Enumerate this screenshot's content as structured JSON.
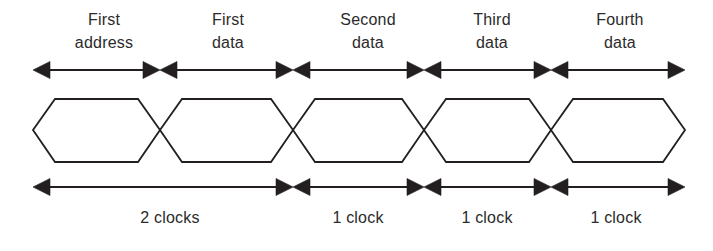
{
  "diagram": {
    "type": "timing-waveform",
    "line_color": "#231f20",
    "text_color": "#2b2b2b",
    "background_color": "#ffffff",
    "line_width": 1.8
  },
  "geometry": {
    "left": 33,
    "right": 685,
    "boundaries": [
      33,
      160,
      293,
      424,
      551,
      685
    ],
    "top_arrow_y": 70,
    "bottom_arrow_y": 187,
    "wave_top": 99,
    "wave_bottom": 162,
    "wave_mid": 130,
    "bevel": 22
  },
  "top_labels": [
    {
      "line1": "First",
      "line2": "address",
      "center_x": 104,
      "top_y": 8
    },
    {
      "line1": "First",
      "line2": "data",
      "center_x": 228,
      "top_y": 8
    },
    {
      "line1": "Second",
      "line2": "data",
      "center_x": 368,
      "top_y": 8
    },
    {
      "line1": "Third",
      "line2": "data",
      "center_x": 492,
      "top_y": 8
    },
    {
      "line1": "Fourth",
      "line2": "data",
      "center_x": 620,
      "top_y": 8
    }
  ],
  "top_arrows": [
    {
      "name": "first-address-span",
      "x1": 33,
      "x2": 160
    },
    {
      "name": "first-data-span",
      "x1": 160,
      "x2": 293
    },
    {
      "name": "second-data-span",
      "x1": 293,
      "x2": 424
    },
    {
      "name": "third-data-span",
      "x1": 424,
      "x2": 551
    },
    {
      "name": "fourth-data-span",
      "x1": 551,
      "x2": 685
    }
  ],
  "wave_cells": [
    {
      "name": "first-address-cell",
      "x1": 33,
      "x2": 160
    },
    {
      "name": "first-data-cell",
      "x1": 160,
      "x2": 293
    },
    {
      "name": "second-data-cell",
      "x1": 293,
      "x2": 424
    },
    {
      "name": "third-data-cell",
      "x1": 424,
      "x2": 551
    },
    {
      "name": "fourth-data-cell",
      "x1": 551,
      "x2": 685
    }
  ],
  "bottom_arrows": [
    {
      "name": "two-clocks-span",
      "x1": 33,
      "x2": 293
    },
    {
      "name": "one-clock-span-1",
      "x1": 293,
      "x2": 424
    },
    {
      "name": "one-clock-span-2",
      "x1": 424,
      "x2": 551
    },
    {
      "name": "one-clock-span-3",
      "x1": 551,
      "x2": 685
    }
  ],
  "bottom_labels": [
    {
      "text": "2 clocks",
      "center_x": 170,
      "top_y": 208
    },
    {
      "text": "1 clock",
      "center_x": 358,
      "top_y": 208
    },
    {
      "text": "1 clock",
      "center_x": 487,
      "top_y": 208
    },
    {
      "text": "1 clock",
      "center_x": 616,
      "top_y": 208
    }
  ]
}
